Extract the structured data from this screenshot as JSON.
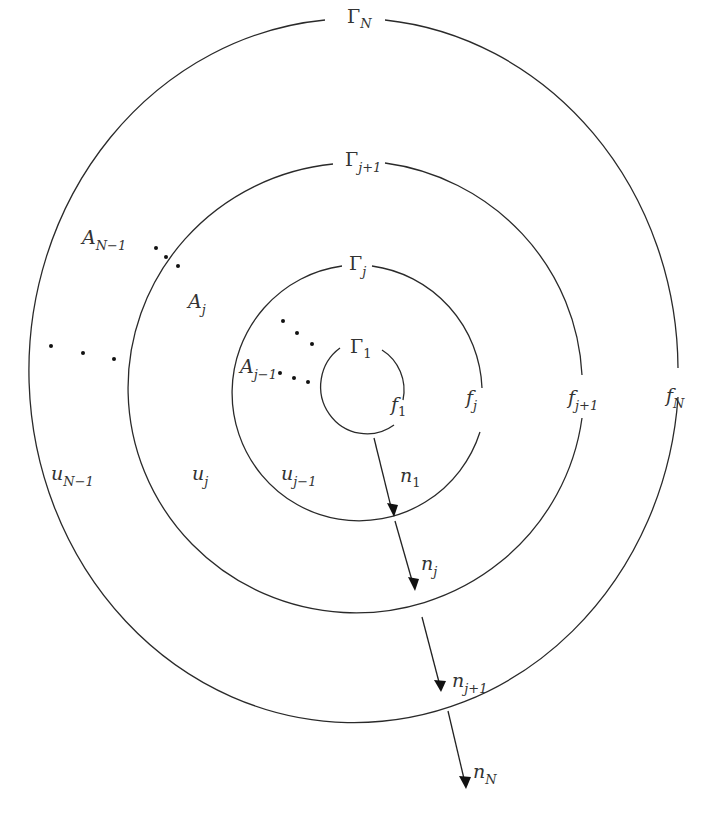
{
  "diagram": {
    "type": "concentric-domains",
    "colors": {
      "stroke": "#2a2a2a",
      "text": "#333333",
      "background": "#ffffff"
    },
    "boundaries": [
      {
        "id": "gamma_1",
        "label": "Γ",
        "sub": "1",
        "f_label": "f",
        "f_sub": "1",
        "n_label": "n",
        "n_sub": "1"
      },
      {
        "id": "gamma_j",
        "label": "Γ",
        "sub": "j",
        "f_label": "f",
        "f_sub": "j",
        "n_label": "n",
        "n_sub": "j"
      },
      {
        "id": "gamma_j1",
        "label": "Γ",
        "sub": "j+1",
        "f_label": "f",
        "f_sub": "j+1",
        "n_label": "n",
        "n_sub": "j+1"
      },
      {
        "id": "gamma_N",
        "label": "Γ",
        "sub": "N",
        "f_label": "f",
        "f_sub": "N",
        "n_label": "n",
        "n_sub": "N"
      }
    ],
    "regions": [
      {
        "id": "A_j-1",
        "label": "A",
        "sub": "j−1",
        "u_label": "u",
        "u_sub": "j−1"
      },
      {
        "id": "A_j",
        "label": "A",
        "sub": "j",
        "u_label": "u",
        "u_sub": "j"
      },
      {
        "id": "A_N-1",
        "label": "A",
        "sub": "N−1",
        "u_label": "u",
        "u_sub": "N−1"
      }
    ],
    "ellipsis_marks": "···"
  }
}
